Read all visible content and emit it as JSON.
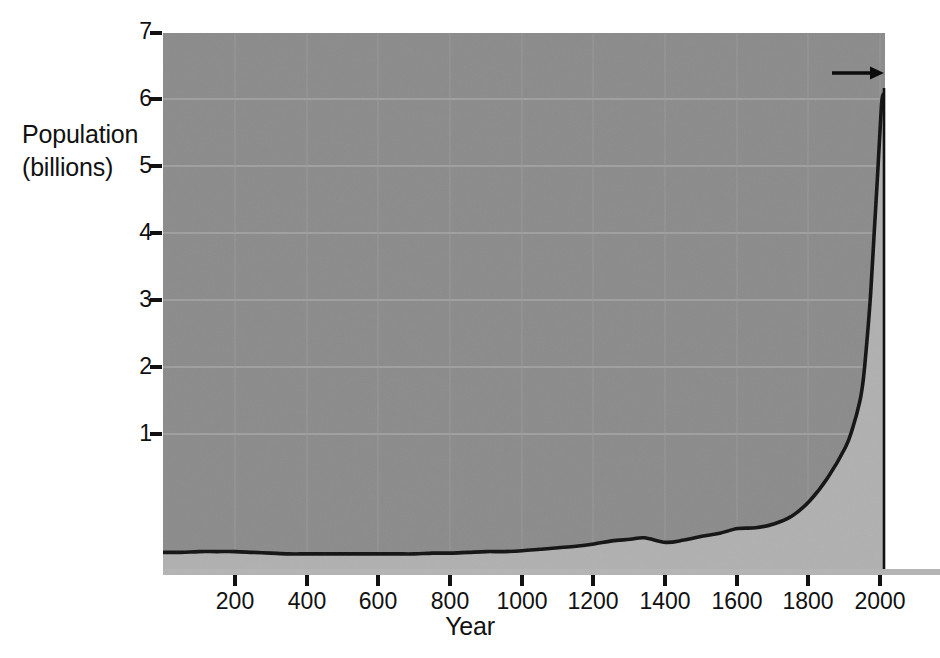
{
  "chart_data": {
    "type": "area",
    "title": "",
    "xlabel": "Year",
    "ylabel": "Population\n(billions)",
    "ylabel_line1": "Population",
    "ylabel_line2": "(billions)",
    "xlim": [
      0,
      2010
    ],
    "ylim": [
      0,
      7
    ],
    "grid": true,
    "legend": "none",
    "xticks": [
      200,
      400,
      600,
      800,
      1000,
      1200,
      1400,
      1600,
      1800,
      2000
    ],
    "xtick_labels": [
      "200",
      "400",
      "600",
      "800",
      "1000",
      "1200",
      "1400",
      "1600",
      "1800",
      "2000"
    ],
    "yticks": [
      1,
      2,
      3,
      4,
      5,
      6,
      7
    ],
    "ytick_labels": [
      "1",
      "2",
      "3",
      "4",
      "5",
      "6",
      "7"
    ],
    "series": [
      {
        "name": "World population",
        "x": [
          0,
          50,
          100,
          150,
          200,
          250,
          300,
          350,
          400,
          450,
          500,
          550,
          600,
          650,
          700,
          750,
          800,
          850,
          900,
          950,
          1000,
          1050,
          1100,
          1150,
          1200,
          1250,
          1300,
          1340,
          1400,
          1450,
          1500,
          1550,
          1600,
          1650,
          1700,
          1750,
          1800,
          1850,
          1900,
          1920,
          1940,
          1950,
          1960,
          1970,
          1980,
          1990,
          2000,
          2005
        ],
        "y": [
          0.23,
          0.23,
          0.24,
          0.24,
          0.24,
          0.23,
          0.22,
          0.21,
          0.21,
          0.21,
          0.21,
          0.21,
          0.21,
          0.21,
          0.21,
          0.22,
          0.22,
          0.23,
          0.24,
          0.24,
          0.25,
          0.27,
          0.29,
          0.31,
          0.34,
          0.38,
          0.4,
          0.42,
          0.36,
          0.39,
          0.44,
          0.48,
          0.54,
          0.55,
          0.6,
          0.7,
          0.9,
          1.2,
          1.6,
          1.85,
          2.2,
          2.5,
          3.0,
          3.6,
          4.4,
          5.2,
          6.05,
          6.2
        ]
      }
    ],
    "annotations": [
      {
        "text": "Us Today",
        "arrow": "right-arrow",
        "points_to_year": 2005,
        "points_to_value": 6.2
      }
    ]
  },
  "colors": {
    "plot_background": "#8b8b8b",
    "area_fill": "#b0b0b0",
    "line": "#121212",
    "gridline": "#a5a5a5",
    "text": "#111111",
    "page_background": "#ffffff",
    "axis_rule": "#9a9a9a"
  },
  "annotation": {
    "label": "Us Today"
  }
}
